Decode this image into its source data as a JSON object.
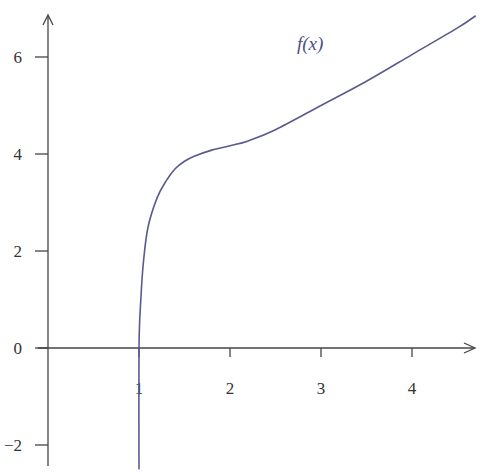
{
  "chart_data": {
    "type": "line",
    "title": "",
    "xlabel": "",
    "ylabel": "",
    "xlim": [
      0,
      4.7
    ],
    "ylim": [
      -2.5,
      7
    ],
    "grid": false,
    "legend": "none",
    "x_ticks": [
      1,
      2,
      3,
      4
    ],
    "x_tick_labels": [
      "1",
      "2",
      "3",
      "4"
    ],
    "y_ticks": [
      -2,
      0,
      2,
      4,
      6
    ],
    "y_tick_labels": [
      "−2",
      "0",
      "2",
      "4",
      "6"
    ],
    "annotations": [
      {
        "text": "f(x)",
        "x": 3.0,
        "y": 6.2
      }
    ],
    "series": [
      {
        "name": "f(x)",
        "color": "#5a5a8f",
        "x": [
          1.0,
          1.0,
          1.02,
          1.05,
          1.1,
          1.2,
          1.3,
          1.4,
          1.5,
          1.6,
          1.8,
          2.0,
          2.2,
          2.5,
          3.0,
          3.5,
          4.0,
          4.5,
          4.7
        ],
        "y": [
          -2.5,
          0.0,
          1.0,
          1.8,
          2.5,
          3.1,
          3.45,
          3.7,
          3.85,
          3.95,
          4.08,
          4.17,
          4.27,
          4.5,
          5.0,
          5.5,
          6.05,
          6.6,
          6.85
        ]
      }
    ]
  },
  "axes": {
    "color": "#444444",
    "curve_color": "#5a5a8f"
  }
}
